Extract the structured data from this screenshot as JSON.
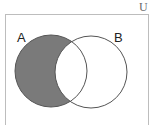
{
  "diagram": {
    "type": "venn",
    "universe_label": "U",
    "sets": [
      {
        "label": "A",
        "cx": 51,
        "cy": 71,
        "r": 36
      },
      {
        "label": "B",
        "cx": 91,
        "cy": 72,
        "r": 36
      }
    ],
    "shaded_region": "A minus B",
    "colors": {
      "shade": "#7a7a7a",
      "outline": "#555555",
      "universe_border": "#bdbdbd",
      "background": "#ffffff"
    }
  }
}
